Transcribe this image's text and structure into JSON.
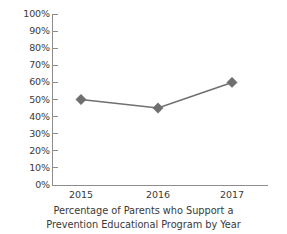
{
  "chart_data": {
    "type": "line",
    "title": "",
    "caption_lines": [
      "Percentage of Parents who Support a",
      "Prevention Educational Program by Year"
    ],
    "categories": [
      "2015",
      "2016",
      "2017"
    ],
    "values": [
      50,
      45,
      60
    ],
    "series": [
      {
        "name": "Percentage of Parents who Support",
        "values": [
          50,
          45,
          60
        ]
      }
    ],
    "xlabel": "",
    "ylabel": "",
    "ylim": [
      0,
      100
    ],
    "y_ticks": [
      100,
      90,
      80,
      70,
      60,
      50,
      40,
      30,
      20,
      10,
      0
    ],
    "y_tick_labels": [
      "100%",
      "90%",
      "80%",
      "70%",
      "60%",
      "50%",
      "40%",
      "30%",
      "20%",
      "10%",
      "0%"
    ],
    "grid": false,
    "legend": "none",
    "marker": "diamond",
    "colors": {
      "line": "#6f6f6f",
      "marker": "#6f6f6f",
      "axis": "#8d8d8d",
      "text": "#3a3a3a",
      "background": "#ffffff"
    }
  }
}
